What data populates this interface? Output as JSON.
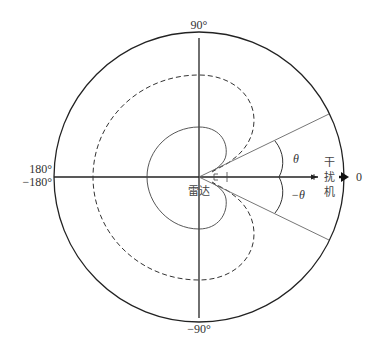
{
  "diagram": {
    "type": "polar-pattern",
    "labels": {
      "top": "90°",
      "bottom": "−90°",
      "left_top": "180°",
      "left_bottom": "−180°",
      "right": "0",
      "theta_pos": "θ",
      "theta_neg": "−θ",
      "radar": "雷达",
      "jammer_line1": "干",
      "jammer_line2": "扰",
      "jammer_line3": "机"
    },
    "curves": [
      {
        "name": "outer-circle",
        "style": "solid"
      },
      {
        "name": "dashed-pattern",
        "style": "dashed"
      },
      {
        "name": "inner-pattern",
        "style": "solid-thin"
      }
    ],
    "colors": {
      "stroke": "#222222",
      "thin_stroke": "#555555",
      "background": "#ffffff"
    }
  }
}
